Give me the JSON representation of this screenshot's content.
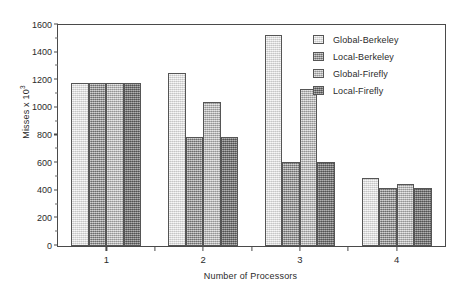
{
  "chart_data": {
    "type": "bar",
    "title": "",
    "xlabel": "Number of Processors",
    "ylabel": "Misses x 10",
    "ylabel_exponent": "3",
    "categories": [
      "1",
      "2",
      "3",
      "4"
    ],
    "ylim": [
      0,
      1600
    ],
    "yticks": [
      0,
      200,
      400,
      600,
      800,
      1000,
      1200,
      1400,
      1600
    ],
    "ytick_labels": [
      "0",
      "200",
      "400",
      "600",
      "800",
      "1000",
      "1200",
      "1400",
      "1600"
    ],
    "grid": false,
    "legend_position": "top-right inside axes",
    "series": [
      {
        "name": "Global-Berkeley",
        "values": [
          1180,
          1255,
          1530,
          490
        ],
        "shade": "#dedede"
      },
      {
        "name": "Local-Berkeley",
        "values": [
          1180,
          790,
          610,
          420
        ],
        "shade": "#8f8f8f"
      },
      {
        "name": "Global-Firefly",
        "values": [
          1180,
          1040,
          1140,
          450
        ],
        "shade": "#b9b9b9"
      },
      {
        "name": "Local-Firefly",
        "values": [
          1180,
          790,
          610,
          420
        ],
        "shade": "#7c7c7c"
      }
    ]
  },
  "legend": {
    "items": [
      {
        "label": "Global-Berkeley"
      },
      {
        "label": "Local-Berkeley"
      },
      {
        "label": "Global-Firefly"
      },
      {
        "label": "Local-Firefly"
      }
    ]
  }
}
